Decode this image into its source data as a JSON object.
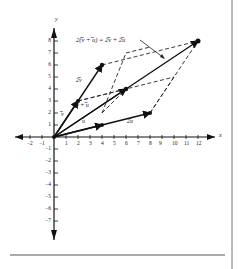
{
  "figure": {
    "equation_label": "2(̅v + ̅u) = 2̅v + 2̅u",
    "vector_labels": {
      "u": "̅u",
      "v": "̅v",
      "sum": "̅v + ̅u",
      "two_v": "2̅v",
      "two_u": "2̅u"
    },
    "axes": {
      "x_label": "x",
      "y_label": "y",
      "x_ticks": [
        "−2",
        "−1",
        "1",
        "2",
        "3",
        "4",
        "5",
        "6",
        "7",
        "8",
        "9",
        "10",
        "11",
        "12"
      ],
      "y_ticks_pos": [
        "1",
        "2",
        "3",
        "4",
        "5",
        "6",
        "7",
        "8"
      ],
      "y_ticks_neg": [
        "−1",
        "−2",
        "−3",
        "−4",
        "−5",
        "−6",
        "−7"
      ]
    },
    "vectors": {
      "u": [
        4,
        1
      ],
      "v": [
        2,
        3
      ],
      "v_plus_u": [
        6,
        4
      ],
      "two_u": [
        8,
        2
      ],
      "two_v": [
        4,
        6
      ],
      "two_sum": [
        12,
        8
      ]
    }
  }
}
